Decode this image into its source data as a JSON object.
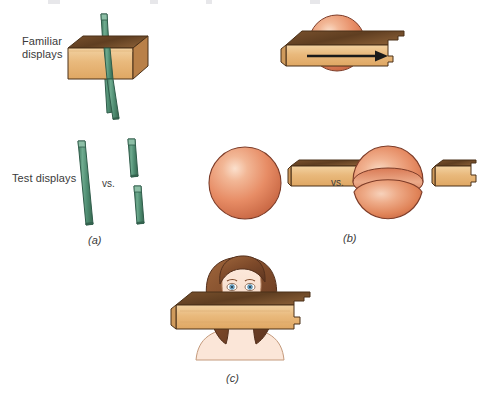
{
  "figure": {
    "background_color": "#ffffff",
    "labels": {
      "familiar_displays": "Familiar\ndisplays",
      "test_displays": "Test displays",
      "vs_a": "vs.",
      "vs_b": "vs.",
      "caption_a": "(a)",
      "caption_b": "(b)",
      "caption_c": "(c)"
    },
    "colors": {
      "rod_green": "#4e8d72",
      "rod_green_light": "#74ae93",
      "rod_outline": "#2f5c4a",
      "block_top_brown": "#6b4526",
      "block_face_tan": "#e7b273",
      "block_face_tan_light": "#f0cd9b",
      "block_side_brown": "#8a5a30",
      "block_outline": "#4a3018",
      "sphere_salmon": "#e58c68",
      "sphere_highlight": "#f6c9ae",
      "sphere_shadow": "#c96a4c",
      "sphere_outline": "#7d3c28",
      "hair_brown": "#8a5332",
      "hair_dark": "#5e3420",
      "skin": "#fbe2d2",
      "skin_outline": "#b98e70",
      "eye_blue": "#6fa8c9",
      "arrow_black": "#1a1a1a",
      "text_gray": "#3a3a3a"
    },
    "panels": {
      "a": {
        "familiar": {
          "description": "green rod passing through a tan rectangular block",
          "rod_orientation": "vertical-tilted"
        },
        "test": {
          "left": "one continuous long green rod",
          "right": "two short collinear green rod segments with a gap"
        }
      },
      "b": {
        "familiar": {
          "description": "salmon sphere behind a tan board, black arrow pointing right",
          "arrow_direction": "right"
        },
        "test": {
          "left": "whole salmon sphere next to a tan block",
          "right": "split salmon sphere (two halves with a band) next to a tan block"
        }
      },
      "c": {
        "description": "woman's face occluded across the eyes by a tan board"
      }
    }
  }
}
